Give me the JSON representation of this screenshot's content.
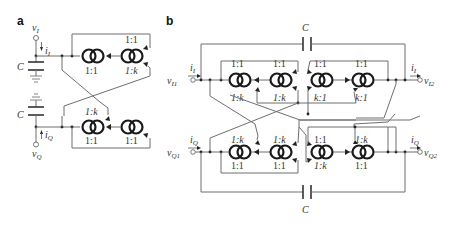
{
  "panels": {
    "a": {
      "label": "a",
      "terminals": {
        "top": {
          "v": "v",
          "v_sub": "I",
          "i": "i",
          "i_sub": "I"
        },
        "bottom": {
          "v": "v",
          "v_sub": "Q",
          "i": "i",
          "i_sub": "Q"
        }
      },
      "capacitors": [
        "C",
        "C"
      ],
      "top_row": {
        "mirror1": {
          "top": "",
          "bottom": "1:1"
        },
        "mirror2": {
          "top": "1:1",
          "bottom": "1:k"
        }
      },
      "bottom_row": {
        "mirror1": {
          "top": "1:k",
          "bottom": "1:1"
        },
        "mirror2": {
          "top": "",
          "bottom": "1:1"
        }
      }
    },
    "b": {
      "label": "b",
      "terminals": {
        "in_top": {
          "v": "v",
          "v_sub": "I1",
          "i": "i",
          "i_sub": "I"
        },
        "out_top": {
          "v": "v",
          "v_sub": "I2",
          "i": "i",
          "i_sub": "I"
        },
        "in_bottom": {
          "v": "v",
          "v_sub": "Q1",
          "i": "i",
          "i_sub": "Q"
        },
        "out_bottom": {
          "v": "v",
          "v_sub": "Q2",
          "i": "i",
          "i_sub": "Q"
        }
      },
      "capacitors": [
        "C",
        "C"
      ],
      "top_row": [
        {
          "top": "1:1",
          "bottom": "1:k"
        },
        {
          "top": "1:1",
          "bottom": "1:k"
        },
        {
          "top": "1:1",
          "bottom": "k:1"
        },
        {
          "top": "1:1",
          "bottom": "k:1"
        }
      ],
      "bottom_row": [
        {
          "top": "1:k",
          "bottom": "1:1"
        },
        {
          "top": "1:k",
          "bottom": "1:1"
        },
        {
          "top": "1:1",
          "bottom": "1:k"
        },
        {
          "top": "1:k",
          "bottom": "1:1"
        }
      ]
    }
  }
}
